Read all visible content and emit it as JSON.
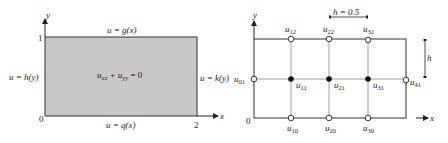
{
  "left_diagram": {
    "axes": {
      "x_label": "x",
      "y_label": "y"
    },
    "ticks": {
      "origin": "0",
      "y_max": "1",
      "x_max": "2"
    },
    "boundary_conditions": {
      "top": "u = g(x)",
      "bottom": "u = q(x)",
      "left": "u = h(y)",
      "right": "u = k(y)"
    },
    "equation": {
      "main": "u",
      "term1_sub": "xx",
      "plus": " + u",
      "term2_sub": "yy",
      "rhs": " = 0"
    },
    "region_color": "#c8c8c8"
  },
  "right_diagram": {
    "axes": {
      "x_label": "x",
      "y_label": "y"
    },
    "origin": "0",
    "step_label": "h = 0.5",
    "vertical_step_label": "h",
    "nodes": {
      "boundary": [
        {
          "name": "u",
          "sub": "12"
        },
        {
          "name": "u",
          "sub": "22"
        },
        {
          "name": "u",
          "sub": "32"
        },
        {
          "name": "u",
          "sub": "01"
        },
        {
          "name": "u",
          "sub": "41"
        },
        {
          "name": "u",
          "sub": "10"
        },
        {
          "name": "u",
          "sub": "20"
        },
        {
          "name": "u",
          "sub": "30"
        }
      ],
      "interior": [
        {
          "name": "u",
          "sub": "11"
        },
        {
          "name": "u",
          "sub": "21"
        },
        {
          "name": "u",
          "sub": "31"
        }
      ]
    }
  }
}
